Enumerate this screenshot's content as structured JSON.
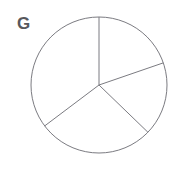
{
  "figure": {
    "label": "G",
    "label_color": "#58585c",
    "background_color": "#ffffff",
    "stroke_color": "#7b7b81",
    "stroke_width": 1
  },
  "chart_data": {
    "type": "pie",
    "title": "G",
    "xlabel": "",
    "ylabel": "",
    "legend_position": "none",
    "grid": false,
    "filled": false,
    "outline_only": true,
    "center": {
      "cx": 99,
      "cy": 85
    },
    "radius": 68,
    "start_angle_deg": 90,
    "direction": "clockwise",
    "categories": [
      "Slice 1",
      "Slice 2",
      "Slice 3",
      "Slice 4"
    ],
    "values": [
      71,
      63,
      99,
      127
    ],
    "units": "degrees",
    "percentages": [
      19.7,
      17.5,
      27.5,
      35.3
    ],
    "boundary_angles_deg": [
      90,
      19,
      -44,
      -143
    ],
    "slices": [
      {
        "name": "Slice 1",
        "position": "top-right",
        "start_angle_deg": 90,
        "end_angle_deg": 19,
        "sweep_deg": 71,
        "percent": 19.7
      },
      {
        "name": "Slice 2",
        "position": "right",
        "start_angle_deg": 19,
        "end_angle_deg": -44,
        "sweep_deg": 63,
        "percent": 17.5
      },
      {
        "name": "Slice 3",
        "position": "bottom",
        "start_angle_deg": -44,
        "end_angle_deg": -143,
        "sweep_deg": 99,
        "percent": 27.5
      },
      {
        "name": "Slice 4",
        "position": "left",
        "start_angle_deg": -143,
        "end_angle_deg": 90,
        "sweep_deg": 127,
        "percent": 35.3
      }
    ],
    "radii_lines": [
      {
        "name": "radius-top",
        "angle_deg": 90,
        "x2": 99,
        "y2": 17
      },
      {
        "name": "radius-upper-right",
        "angle_deg": 19,
        "x2": 163,
        "y2": 63
      },
      {
        "name": "radius-lower-right",
        "angle_deg": -44,
        "x2": 148,
        "y2": 132
      },
      {
        "name": "radius-lower-left",
        "angle_deg": -143,
        "x2": 45,
        "y2": 126
      }
    ]
  }
}
